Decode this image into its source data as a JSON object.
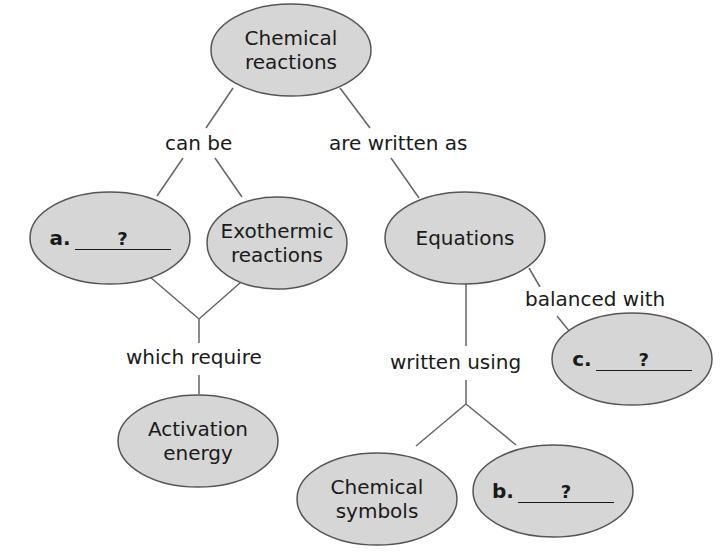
{
  "diagram": {
    "type": "concept-map",
    "colors": {
      "node_fill": "#d6d6d6",
      "node_stroke": "#555555",
      "line": "#666666",
      "background": "#ffffff"
    },
    "nodes": {
      "chemical_reactions": {
        "line1": "Chemical",
        "line2": "reactions"
      },
      "a": {
        "letter": "a.",
        "blank": "?"
      },
      "exothermic": {
        "line1": "Exothermic",
        "line2": "reactions"
      },
      "equations": {
        "label": "Equations"
      },
      "c": {
        "letter": "c.",
        "blank": "?"
      },
      "activation_energy": {
        "line1": "Activation",
        "line2": "energy"
      },
      "chemical_symbols": {
        "line1": "Chemical",
        "line2": "symbols"
      },
      "b": {
        "letter": "b.",
        "blank": "?"
      }
    },
    "links": {
      "can_be": "can be",
      "are_written_as": "are written as",
      "which_require": "which require",
      "balanced_with": "balanced with",
      "written_using": "written using"
    }
  }
}
